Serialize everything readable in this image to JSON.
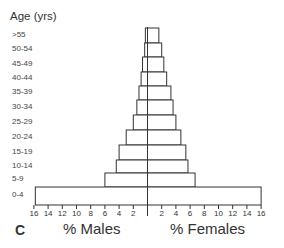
{
  "chart_data": {
    "type": "bar",
    "subtype": "population-pyramid",
    "panel_label": "C",
    "y_title": "Age (yrs)",
    "categories": [
      ">55",
      "50-54",
      "45-49",
      "40-44",
      "35-39",
      "30-34",
      "25-29",
      "20-24",
      "15-19",
      "10-14",
      "5-9",
      "0-4"
    ],
    "series": [
      {
        "name": "% Males",
        "side": "left",
        "values": [
          0.3,
          0.4,
          0.7,
          0.9,
          1.2,
          1.5,
          2.0,
          3.0,
          4.0,
          4.4,
          6.0,
          15.8
        ]
      },
      {
        "name": "% Females",
        "side": "right",
        "values": [
          1.6,
          2.0,
          2.3,
          2.7,
          3.3,
          3.6,
          4.0,
          4.7,
          5.4,
          5.7,
          6.7,
          16.0
        ]
      }
    ],
    "xlabel_left": "% Males",
    "xlabel_right": "% Females",
    "x_ticks_left": [
      "16",
      "14",
      "12",
      "10",
      "8",
      "6",
      "4",
      "2"
    ],
    "x_ticks_right": [
      "2",
      "4",
      "6",
      "8",
      "10",
      "12",
      "14",
      "16"
    ],
    "xlim": [
      -16,
      16
    ],
    "grid": false,
    "legend": "none",
    "bar_fill": "#ffffff",
    "bar_stroke": "#333333"
  }
}
